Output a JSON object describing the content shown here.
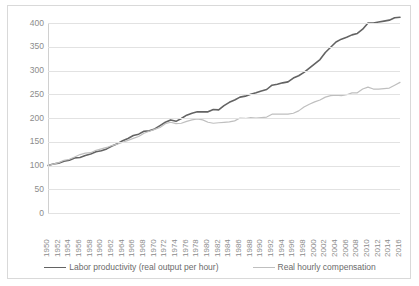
{
  "chart_data": {
    "type": "line",
    "title": "",
    "xlabel": "",
    "ylabel": "",
    "ylim": [
      0,
      400
    ],
    "ytick_step": 50,
    "grid": true,
    "legend_position": "bottom",
    "index_base": "1950 = 100",
    "yticks": [
      "400",
      "350",
      "300",
      "250",
      "200",
      "150",
      "100",
      "50",
      "0"
    ],
    "categories": [
      "1950",
      "1951",
      "1952",
      "1953",
      "1954",
      "1955",
      "1956",
      "1957",
      "1958",
      "1959",
      "1960",
      "1961",
      "1962",
      "1963",
      "1964",
      "1965",
      "1966",
      "1967",
      "1968",
      "1969",
      "1970",
      "1971",
      "1972",
      "1973",
      "1974",
      "1975",
      "1976",
      "1977",
      "1978",
      "1979",
      "1980",
      "1981",
      "1982",
      "1983",
      "1984",
      "1985",
      "1986",
      "1987",
      "1988",
      "1989",
      "1990",
      "1991",
      "1992",
      "1993",
      "1994",
      "1995",
      "1996",
      "1997",
      "1998",
      "1999",
      "2000",
      "2001",
      "2002",
      "2003",
      "2004",
      "2005",
      "2006",
      "2007",
      "2008",
      "2009",
      "2010",
      "2011",
      "2012",
      "2013",
      "2014",
      "2015",
      "2016"
    ],
    "xtick_labels": [
      "1950",
      "1952",
      "1954",
      "1956",
      "1958",
      "1960",
      "1962",
      "1964",
      "1966",
      "1968",
      "1970",
      "1972",
      "1974",
      "1976",
      "1978",
      "1980",
      "1982",
      "1984",
      "1986",
      "1988",
      "1990",
      "1992",
      "1994",
      "1996",
      "1998",
      "2000",
      "2002",
      "2004",
      "2006",
      "2008",
      "2010",
      "2012",
      "2014",
      "2016"
    ],
    "series": [
      {
        "name": "Labor productivity (real output per hour)",
        "color": "#636363",
        "values": [
          100,
          103,
          105,
          109,
          111,
          116,
          117,
          121,
          124,
          129,
          131,
          135,
          141,
          146,
          152,
          157,
          163,
          166,
          172,
          173,
          177,
          184,
          191,
          196,
          193,
          199,
          206,
          210,
          213,
          213,
          213,
          218,
          217,
          226,
          233,
          238,
          244,
          246,
          250,
          253,
          257,
          260,
          269,
          271,
          274,
          276,
          284,
          289,
          296,
          305,
          314,
          323,
          338,
          349,
          360,
          366,
          370,
          375,
          378,
          387,
          400,
          400,
          402,
          404,
          406,
          411,
          412
        ]
      },
      {
        "name": "Real hourly compensation",
        "color": "#bfbfbf",
        "values": [
          100,
          103,
          106,
          111,
          113,
          118,
          123,
          126,
          127,
          132,
          135,
          138,
          142,
          145,
          149,
          153,
          157,
          161,
          168,
          172,
          176,
          180,
          188,
          191,
          188,
          189,
          193,
          196,
          198,
          196,
          191,
          189,
          190,
          191,
          192,
          194,
          200,
          199,
          201,
          200,
          201,
          202,
          208,
          208,
          208,
          208,
          210,
          215,
          223,
          229,
          234,
          238,
          244,
          247,
          248,
          247,
          249,
          253,
          253,
          261,
          265,
          261,
          261,
          262,
          263,
          269,
          275
        ]
      }
    ]
  },
  "legend": {
    "entries": [
      {
        "label": "Labor productivity (real output per hour)"
      },
      {
        "label": "Real hourly compensation"
      }
    ]
  }
}
